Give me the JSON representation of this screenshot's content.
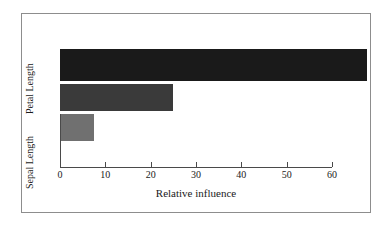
{
  "chart_data": {
    "type": "bar",
    "orientation": "horizontal",
    "title": "",
    "xlabel": "Relative influence",
    "ylabel": "",
    "xlim": [
      0,
      60
    ],
    "xticks": [
      0,
      10,
      20,
      30,
      40,
      50,
      60
    ],
    "xtick_labels": [
      "0",
      "10",
      "20",
      "30",
      "40",
      "50",
      "60"
    ],
    "grid": false,
    "legend": false,
    "categories": [
      "Petal Length",
      "",
      "Sepal Length"
    ],
    "values": [
      67.7,
      25.0,
      7.5
    ],
    "bars": [
      {
        "label": "Petal Length",
        "value": 67.7,
        "color": "#1a1a1a"
      },
      {
        "label": "",
        "value": 25.0,
        "color": "#3a3a3a"
      },
      {
        "label": "Sepal Length",
        "value": 7.5,
        "color": "#707070"
      }
    ],
    "axis_labels_visible": [
      "Petal Length",
      "Sepal Length"
    ],
    "colors": {
      "bar_1": "#1a1a1a",
      "bar_2": "#3a3a3a",
      "bar_3": "#707070",
      "axis": "#4a4a4a",
      "frame": "#8d8d8d",
      "background": "#ffffff",
      "text": "#1a1a1a"
    }
  },
  "figure": {
    "x_axis_title": "Relative influence",
    "y_label_top": "Petal Length",
    "y_label_bottom": "Sepal Length"
  }
}
